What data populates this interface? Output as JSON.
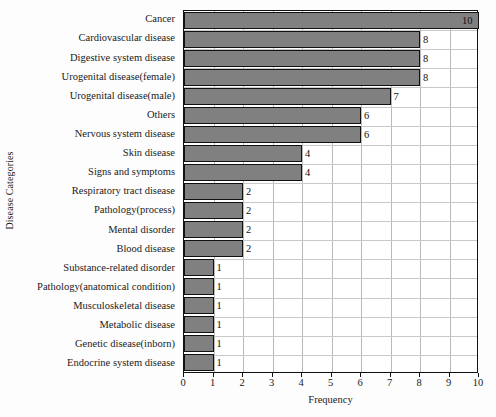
{
  "chart_data": {
    "type": "bar",
    "orientation": "horizontal",
    "title": "",
    "xlabel": "Frequency",
    "ylabel": "Disease Categories",
    "xlim": [
      0,
      10
    ],
    "xticks": [
      0,
      1,
      2,
      3,
      4,
      5,
      6,
      7,
      8,
      9,
      10
    ],
    "grid": true,
    "legend": false,
    "bar_color": "#808080",
    "bar_edge_color": "#111111",
    "categories": [
      "Cancer",
      "Cardiovascular disease",
      "Digestive system disease",
      "Urogenital disease(female)",
      "Urogenital disease(male)",
      "Others",
      "Nervous system disease",
      "Skin disease",
      "Signs and symptoms",
      "Respiratory tract disease",
      "Pathology(process)",
      "Mental disorder",
      "Blood disease",
      "Substance-related disorder",
      "Pathology(anatomical condition)",
      "Musculoskeletal disease",
      "Metabolic disease",
      "Genetic disease(inborn)",
      "Endocrine system disease"
    ],
    "values": [
      10,
      8,
      8,
      8,
      7,
      6,
      6,
      4,
      4,
      2,
      2,
      2,
      2,
      1,
      1,
      1,
      1,
      1,
      1
    ],
    "value_labels": [
      "10",
      "8",
      "8",
      "8",
      "7",
      "6",
      "6",
      "4",
      "4",
      "2",
      "2",
      "2",
      "2",
      "1",
      "1",
      "1",
      "1",
      "1",
      "1"
    ]
  }
}
